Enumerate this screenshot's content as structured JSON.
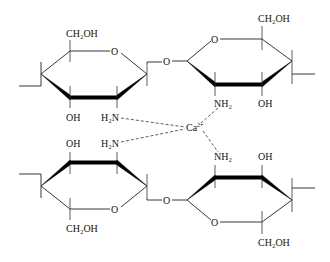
{
  "diagram": {
    "rings": [
      {
        "id": "top-left",
        "substituents": {
          "ch2oh": "CH₂OH",
          "ring_o": "O",
          "oh": "OH",
          "amine": "H₂N"
        }
      },
      {
        "id": "top-right",
        "substituents": {
          "ch2oh": "CH₂OH",
          "ring_o": "O",
          "oh": "OH",
          "amine": "NH₂"
        }
      },
      {
        "id": "bottom-left",
        "substituents": {
          "ch2oh": "CH₂OH",
          "ring_o": "O",
          "oh": "OH",
          "amine": "H₂N"
        }
      },
      {
        "id": "bottom-right",
        "substituents": {
          "ch2oh": "CH₂OH",
          "ring_o": "O",
          "oh": "OH",
          "amine": "NH₂"
        }
      }
    ],
    "glycosidic_links": [
      "O",
      "O"
    ],
    "metal_ion": {
      "symbol": "Ca",
      "charge": "2+"
    },
    "coordination": "4 amine groups (NH₂) coordinate to central Ca²⁺ via dashed bonds"
  }
}
